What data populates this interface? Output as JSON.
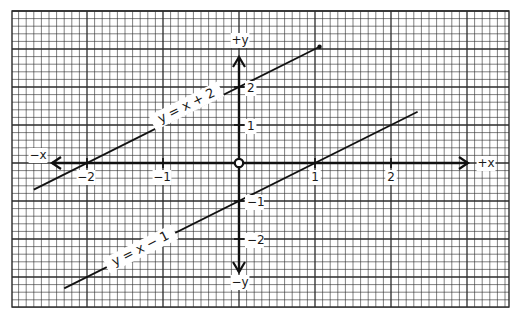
{
  "chart_data": {
    "type": "line",
    "title": "",
    "xlabel": "+x",
    "ylabel": "+y",
    "axis_labels": {
      "pos_x": "+x",
      "neg_x": "−x",
      "pos_y": "+y",
      "neg_y": "−y"
    },
    "xlim": [
      -2.7,
      2.9
    ],
    "ylim": [
      -3.7,
      4.0
    ],
    "grid": true,
    "x_ticks": [
      {
        "value": -2,
        "label": "−2"
      },
      {
        "value": -1,
        "label": "−1"
      },
      {
        "value": 1,
        "label": "1"
      },
      {
        "value": 2,
        "label": "2"
      }
    ],
    "y_ticks": [
      {
        "value": 2,
        "label": "2"
      },
      {
        "value": 1,
        "label": "1"
      },
      {
        "value": -1,
        "label": "−1"
      },
      {
        "value": -2,
        "label": "−2"
      }
    ],
    "origin_marker": "open-circle",
    "series": [
      {
        "name": "y = x + 2",
        "slope": 1,
        "intercept": 2,
        "x": [
          -2.7,
          1.06
        ],
        "y": [
          -0.7,
          3.06
        ],
        "label": "y = x + 2"
      },
      {
        "name": "y = x − 1",
        "slope": 1,
        "intercept": -1,
        "x": [
          -2.3,
          2.35
        ],
        "y": [
          -3.3,
          1.35
        ],
        "label": "y = x − 1"
      }
    ],
    "legend": "none (inline labels along lines)"
  },
  "colors": {
    "grid": "#2a2a2a",
    "axis": "#111111",
    "line": "#111111",
    "background": "#ffffff"
  }
}
